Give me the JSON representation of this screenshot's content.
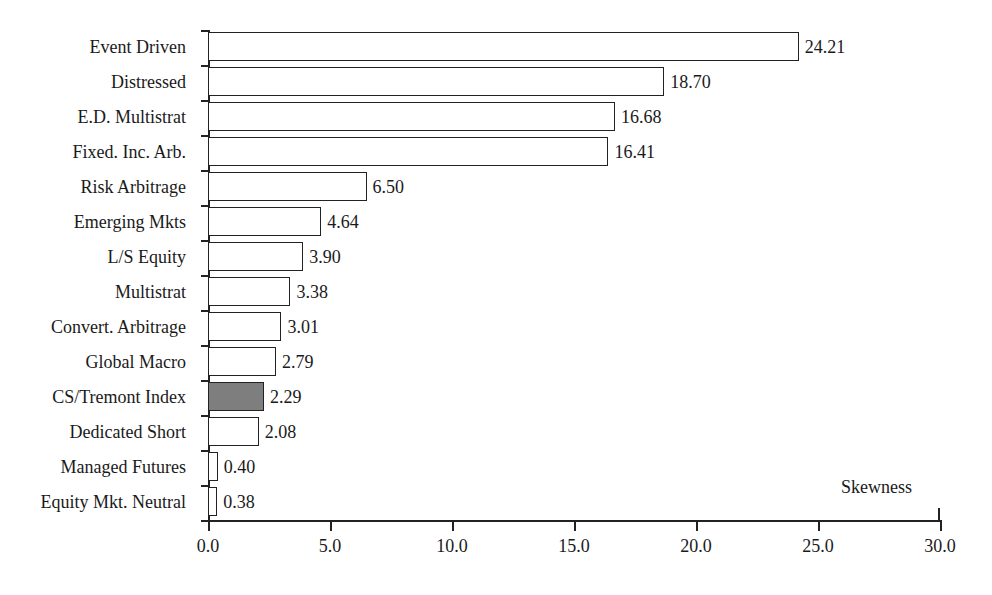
{
  "chart_data": {
    "type": "bar",
    "orientation": "horizontal",
    "title": "",
    "xlabel": "Skewness",
    "ylabel": "",
    "xlim": [
      0.0,
      30.0
    ],
    "xticks": [
      "0.0",
      "5.0",
      "10.0",
      "15.0",
      "20.0",
      "25.0",
      "30.0"
    ],
    "xtick_values": [
      0.0,
      5.0,
      10.0,
      15.0,
      20.0,
      25.0,
      30.0
    ],
    "grid": false,
    "legend": "none",
    "categories": [
      "Event Driven",
      "Distressed",
      "E.D. Multistrat",
      "Fixed. Inc. Arb.",
      "Risk Arbitrage",
      "Emerging Mkts",
      "L/S Equity",
      "Multistrat",
      "Convert. Arbitrage",
      "Global Macro",
      "CS/Tremont Index",
      "Dedicated Short",
      "Managed Futures",
      "Equity Mkt. Neutral"
    ],
    "values": [
      24.21,
      18.7,
      16.68,
      16.41,
      6.5,
      4.64,
      3.9,
      3.38,
      3.01,
      2.79,
      2.29,
      2.08,
      0.4,
      0.38
    ],
    "value_labels": [
      "24.21",
      "18.70",
      "16.68",
      "16.41",
      "6.50",
      "4.64",
      "3.90",
      "3.38",
      "3.01",
      "2.79",
      "2.29",
      "2.08",
      "0.40",
      "0.38"
    ],
    "highlighted_category": "CS/Tremont Index",
    "colors": {
      "bar_fill": "#ffffff",
      "bar_edge": "#222222",
      "highlight_fill": "#7e7e7e",
      "axis": "#222222",
      "text": "#1a1a1a",
      "background": "#ffffff"
    }
  }
}
